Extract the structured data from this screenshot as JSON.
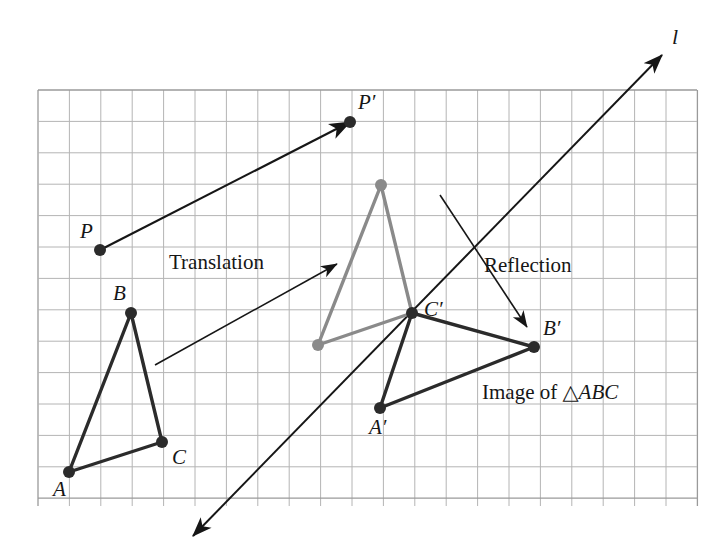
{
  "figure": {
    "canvas": {
      "width": 727,
      "height": 560,
      "background": "#ffffff"
    },
    "grid": {
      "x0": 38,
      "y0": 90,
      "x1": 697,
      "y1": 506,
      "cell": 31.4,
      "cols": 21,
      "rows": 13,
      "line_color": "#b4b4b4",
      "border_color": "#9a9a9a",
      "visible": true
    },
    "colors": {
      "dark": "#2b2b2b",
      "gray": "#8a8a8a",
      "grid": "#b4b4b4",
      "text": "#161616"
    }
  },
  "labels": {
    "line_l": "l",
    "P": "P",
    "P_prime": "P′",
    "A": "A",
    "B": "B",
    "C": "C",
    "A_prime": "A′",
    "B_prime": "B′",
    "C_prime": "C′",
    "translation": "Translation",
    "reflection": "Reflection",
    "image_of_prefix": "Image of ",
    "image_of_triangle": "△ABC"
  },
  "chart_data": {
    "type": "scatter",
    "xlabel": "",
    "ylabel": "",
    "grid": true,
    "legend": "none",
    "xlim": [
      38,
      697
    ],
    "ylim": [
      90,
      506
    ],
    "points": [
      {
        "name": "P",
        "label": "P",
        "x": 100,
        "y": 250,
        "color": "#2b2b2b",
        "r": 6.0,
        "label_dx": -20,
        "label_dy": -12
      },
      {
        "name": "P'",
        "label": "P′",
        "x": 350,
        "y": 122,
        "color": "#2b2b2b",
        "r": 6.0,
        "label_dx": 8,
        "label_dy": -13
      },
      {
        "name": "A",
        "label": "A",
        "x": 69,
        "y": 472,
        "color": "#2b2b2b",
        "r": 6.0,
        "label_dx": -16,
        "label_dy": 24
      },
      {
        "name": "B",
        "label": "B",
        "x": 131,
        "y": 313,
        "color": "#2b2b2b",
        "r": 6.0,
        "label_dx": -18,
        "label_dy": -13
      },
      {
        "name": "C",
        "label": "C",
        "x": 162,
        "y": 442,
        "color": "#2b2b2b",
        "r": 6.0,
        "label_dx": 10,
        "label_dy": 22
      },
      {
        "name": "At",
        "label": "",
        "x": 318,
        "y": 345,
        "color": "#8a8a8a",
        "r": 6.0,
        "label_dx": 0,
        "label_dy": 0
      },
      {
        "name": "Bt",
        "label": "",
        "x": 381,
        "y": 185,
        "color": "#8a8a8a",
        "r": 6.0,
        "label_dx": 0,
        "label_dy": 0
      },
      {
        "name": "A'",
        "label": "A′",
        "x": 380,
        "y": 408,
        "color": "#2b2b2b",
        "r": 6.0,
        "label_dx": -11,
        "label_dy": 26
      },
      {
        "name": "B'",
        "label": "B′",
        "x": 534,
        "y": 347,
        "color": "#2b2b2b",
        "r": 6.0,
        "label_dx": 9,
        "label_dy": -12
      },
      {
        "name": "C'",
        "label": "C′",
        "x": 412,
        "y": 313,
        "color": "#2b2b2b",
        "r": 6.0,
        "label_dx": 12,
        "label_dy": 3
      }
    ],
    "shapes": [
      {
        "name": "triangle-abc",
        "kind": "polygon",
        "points": [
          [
            69,
            472
          ],
          [
            131,
            313
          ],
          [
            162,
            442
          ]
        ],
        "color": "#2b2b2b",
        "width": 3.4
      },
      {
        "name": "triangle-translated",
        "kind": "polygon",
        "points": [
          [
            318,
            345
          ],
          [
            381,
            185
          ],
          [
            412,
            313
          ]
        ],
        "color": "#8a8a8a",
        "width": 3.4
      },
      {
        "name": "triangle-reflected",
        "kind": "polygon",
        "points": [
          [
            380,
            408
          ],
          [
            412,
            313
          ],
          [
            534,
            347
          ]
        ],
        "color": "#2b2b2b",
        "width": 3.4
      }
    ],
    "arrows": [
      {
        "name": "translation-vector-p",
        "from": [
          100,
          250
        ],
        "to": [
          350,
          122
        ],
        "color": "#161616",
        "width": 2.2,
        "head": 13
      },
      {
        "name": "translation-callout",
        "from": [
          155,
          365
        ],
        "to": [
          337,
          264
        ],
        "color": "#161616",
        "width": 1.6,
        "head": 11
      },
      {
        "name": "reflection-callout",
        "from": [
          440,
          195
        ],
        "to": [
          527,
          327
        ],
        "color": "#161616",
        "width": 1.6,
        "head": 11
      }
    ],
    "lines": [
      {
        "name": "mirror-line-l",
        "from": [
          193,
          536
        ],
        "to": [
          662,
          55
        ],
        "color": "#161616",
        "width": 2.0,
        "head": 13,
        "double_headed": true
      }
    ],
    "annotations": [
      {
        "name": "line-l-label",
        "text": "l",
        "x": 672,
        "y": 44,
        "style": "italic"
      },
      {
        "name": "translation-label",
        "text": "Translation",
        "x": 169,
        "y": 269,
        "style": "roman"
      },
      {
        "name": "reflection-label",
        "text": "Reflection",
        "x": 484,
        "y": 272,
        "style": "roman"
      },
      {
        "name": "image-label",
        "text": "Image of △ABC",
        "x": 482,
        "y": 399,
        "style": "mixed"
      }
    ]
  }
}
